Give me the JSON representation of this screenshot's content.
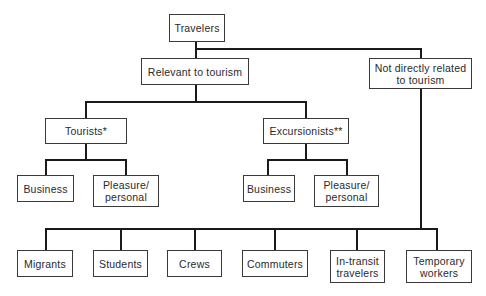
{
  "diagram": {
    "type": "hierarchy",
    "root": {
      "label": "Travelers"
    },
    "level1": {
      "relevant": {
        "label": "Relevant to tourism"
      },
      "not_related": {
        "label": "Not directly related to tourism",
        "line1": "Not directly related",
        "line2": "to tourism"
      }
    },
    "tourists": {
      "label": "Tourists*",
      "children": [
        {
          "label": "Business"
        },
        {
          "label": "Pleasure/ personal",
          "line1": "Pleasure/",
          "line2": "personal"
        }
      ]
    },
    "excursionists": {
      "label": "Excursionists**",
      "children": [
        {
          "label": "Business"
        },
        {
          "label": "Pleasure/ personal",
          "line1": "Pleasure/",
          "line2": "personal"
        }
      ]
    },
    "not_related_children": [
      {
        "label": "Migrants"
      },
      {
        "label": "Students"
      },
      {
        "label": "Crews"
      },
      {
        "label": "Commuters"
      },
      {
        "label": "In-transit travelers",
        "line1": "In-transit",
        "line2": "travelers"
      },
      {
        "label": "Temporary workers",
        "line1": "Temporary",
        "line2": "workers"
      }
    ]
  }
}
